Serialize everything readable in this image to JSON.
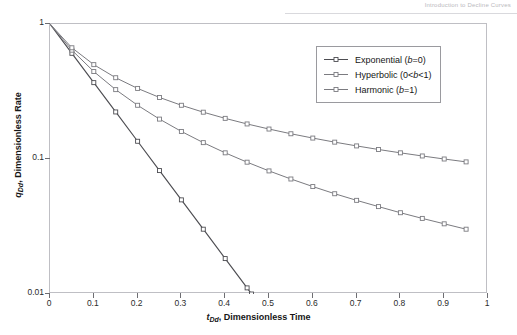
{
  "page_header": {
    "running_head": "Introduction to Decline Curves"
  },
  "chart_data": {
    "type": "line",
    "title": "",
    "xlabel": "t_Dd , Dimensionless Time",
    "ylabel": "q_Dd , Dimensionless Rate",
    "xlabel_parts": {
      "symbol": "t",
      "subscript": "Dd",
      "rest": ", Dimensionless Time"
    },
    "ylabel_parts": {
      "symbol": "q",
      "subscript": "Dd",
      "rest": ", Dimensionless Rate"
    },
    "xscale": "linear",
    "yscale": "log",
    "xlim": [
      0,
      1
    ],
    "ylim": [
      0.01,
      1
    ],
    "grid": false,
    "legend_position": "upper-right",
    "xticks": [
      "0",
      "0.1",
      "0.2",
      "0.3",
      "0.4",
      "0.5",
      "0.6",
      "0.7",
      "0.8",
      "0.9",
      "1"
    ],
    "xtick_values": [
      0,
      0.1,
      0.2,
      0.3,
      0.4,
      0.5,
      0.6,
      0.7,
      0.8,
      0.9,
      1
    ],
    "yticks": [
      "1",
      "0.1",
      "0.01"
    ],
    "ytick_values": [
      1,
      0.1,
      0.01
    ],
    "marker": "square",
    "line_color": "#7b7b80",
    "exponential_color": "#4d4d52",
    "series": [
      {
        "name": "Exponential (b=0)",
        "legend_label_plain": "Exponential (b=0)",
        "legend_prefix": "Exponential (",
        "legend_italic": "b",
        "legend_suffix": "=0)",
        "b": 0,
        "formula": "q = exp(-10 t)",
        "x": [
          0,
          0.05,
          0.1,
          0.15,
          0.2,
          0.25,
          0.3,
          0.35,
          0.4,
          0.45,
          0.46
        ],
        "values": [
          1,
          0.6065,
          0.3679,
          0.2231,
          0.1353,
          0.0821,
          0.0498,
          0.0302,
          0.0183,
          0.0111,
          0.01
        ]
      },
      {
        "name": "Hyperbolic (0<b<1)",
        "legend_label_plain": "Hyperbolic (0<b<1)",
        "legend_prefix": "Hyperbolic (0<",
        "legend_italic": "b",
        "legend_suffix": "<1)",
        "b": 0.5,
        "formula": "q = (1 + 5 t)^(-2)",
        "x": [
          0,
          0.05,
          0.1,
          0.15,
          0.2,
          0.25,
          0.3,
          0.35,
          0.4,
          0.45,
          0.5,
          0.55,
          0.6,
          0.65,
          0.7,
          0.75,
          0.8,
          0.85,
          0.9,
          0.95
        ],
        "values": [
          1,
          0.64,
          0.4444,
          0.3265,
          0.25,
          0.1975,
          0.16,
          0.1322,
          0.1111,
          0.0947,
          0.0816,
          0.0711,
          0.0625,
          0.0553,
          0.0494,
          0.0444,
          0.04,
          0.0363,
          0.0331,
          0.0302
        ]
      },
      {
        "name": "Harmonic (b=1)",
        "legend_label_plain": "Harmonic (b=1)",
        "legend_prefix": "Harmonic (",
        "legend_italic": "b",
        "legend_suffix": "=1)",
        "b": 1,
        "formula": "q = 1 / (1 + 10 t)",
        "x": [
          0,
          0.05,
          0.1,
          0.15,
          0.2,
          0.25,
          0.3,
          0.35,
          0.4,
          0.45,
          0.5,
          0.55,
          0.6,
          0.65,
          0.7,
          0.75,
          0.8,
          0.85,
          0.9,
          0.95
        ],
        "values": [
          1,
          0.6667,
          0.5,
          0.4,
          0.3333,
          0.2857,
          0.25,
          0.2222,
          0.2,
          0.1818,
          0.1667,
          0.1538,
          0.1429,
          0.1333,
          0.125,
          0.1176,
          0.1111,
          0.1053,
          0.1,
          0.0952
        ]
      }
    ]
  }
}
